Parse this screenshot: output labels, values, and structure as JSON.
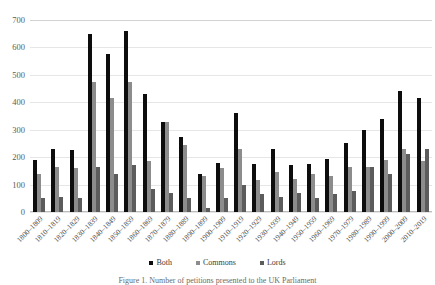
{
  "chart_data": {
    "type": "bar",
    "title": "",
    "xlabel": "",
    "ylabel": "",
    "ylim": [
      0,
      700
    ],
    "yticks": [
      0,
      100,
      200,
      300,
      400,
      500,
      600,
      700
    ],
    "grid": true,
    "legend_position": "bottom",
    "categories": [
      "1800–1809",
      "1810–1819",
      "1820–1829",
      "1830–1839",
      "1840–1849",
      "1850–1859",
      "1860–1869",
      "1870–1879",
      "1880–1889",
      "1890–1899",
      "1900–1909",
      "1910–1919",
      "1920–1929",
      "1930–1939",
      "1940–1949",
      "1950–1959",
      "1960–1969",
      "1970–1979",
      "1980–1989",
      "1990–1999",
      "2000–2009",
      "2010–2019"
    ],
    "series": [
      {
        "name": "Both",
        "color": "#0d0d0d",
        "values": [
          190,
          230,
          225,
          650,
          575,
          660,
          430,
          330,
          275,
          140,
          180,
          360,
          175,
          230,
          170,
          175,
          195,
          250,
          300,
          340,
          440,
          415
        ]
      },
      {
        "name": "Commons",
        "color": "#8c8c8c",
        "values": [
          140,
          165,
          160,
          475,
          415,
          475,
          185,
          330,
          245,
          130,
          160,
          230,
          115,
          145,
          120,
          140,
          130,
          165,
          165,
          190,
          230,
          185
        ]
      },
      {
        "name": "Lords",
        "color": "#5c5c5c",
        "values": [
          50,
          55,
          50,
          165,
          140,
          170,
          85,
          70,
          50,
          15,
          50,
          100,
          65,
          55,
          70,
          50,
          65,
          75,
          165,
          140,
          210,
          230
        ]
      }
    ]
  },
  "legend": {
    "items": [
      {
        "label": "Both",
        "color": "#0d0d0d"
      },
      {
        "label": "Commons",
        "color": "#8c8c8c"
      },
      {
        "label": "Lords",
        "color": "#5c5c5c"
      }
    ]
  },
  "caption": {
    "text": "Figure 1. Number of petitions presented to the UK Parliament"
  }
}
